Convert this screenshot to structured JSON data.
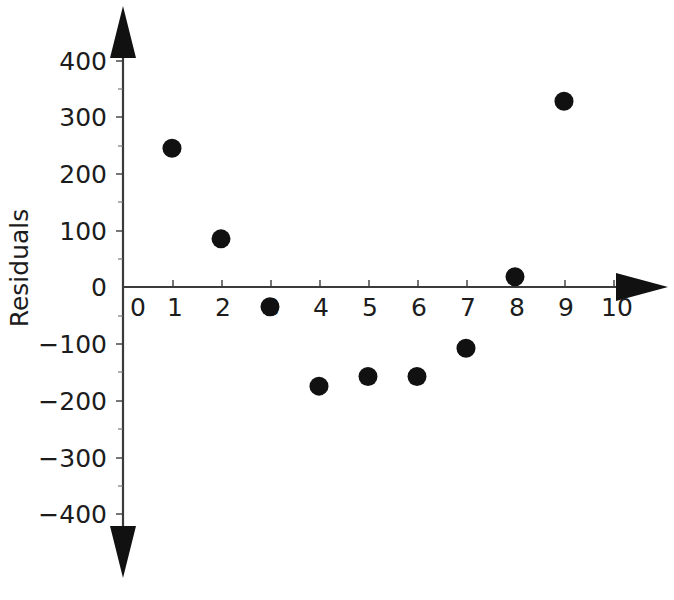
{
  "chart_data": {
    "type": "scatter",
    "title": "",
    "xlabel": "",
    "ylabel": "Residuals",
    "x": [
      1,
      2,
      3,
      4,
      5,
      6,
      7,
      8,
      9
    ],
    "values": [
      245,
      85,
      -35,
      -175,
      -158,
      -158,
      -108,
      18,
      328
    ],
    "points": [
      {
        "x": 1,
        "y": 245
      },
      {
        "x": 2,
        "y": 85
      },
      {
        "x": 3,
        "y": -35
      },
      {
        "x": 4,
        "y": -175
      },
      {
        "x": 5,
        "y": -158
      },
      {
        "x": 6,
        "y": -158
      },
      {
        "x": 7,
        "y": -108
      },
      {
        "x": 8,
        "y": 18
      },
      {
        "x": 9,
        "y": 328
      }
    ],
    "xlim": [
      0,
      10
    ],
    "ylim": [
      -400,
      400
    ],
    "x_tick_labels": [
      "0",
      "1",
      "2",
      "3",
      "4",
      "5",
      "6",
      "7",
      "8",
      "9",
      "10"
    ],
    "x_tick_values": [
      0,
      1,
      2,
      3,
      4,
      5,
      6,
      7,
      8,
      9,
      10
    ],
    "y_tick_labels": [
      "400",
      "300",
      "200",
      "100",
      "0",
      "−100",
      "−200",
      "−300",
      "−400"
    ],
    "y_tick_values": [
      400,
      300,
      200,
      100,
      0,
      -100,
      -200,
      -300,
      -400
    ],
    "y_minor_tick_values": [
      350,
      250,
      150,
      50,
      -50,
      -150,
      -250,
      -350
    ],
    "grid": false,
    "legend": null,
    "marker": "filled-circle",
    "marker_color": "#111111",
    "axis_color": "#3b3b3b",
    "background_color": "#ffffff",
    "axis_style": "double-arrow-cross"
  },
  "axes": {
    "y_axis_title": "Residuals",
    "x_axis_title": ""
  },
  "colors": {
    "marker": "#111111",
    "axis": "#3b3b3b",
    "text": "#1c1c1c",
    "background": "#ffffff"
  }
}
